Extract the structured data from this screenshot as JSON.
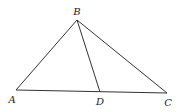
{
  "diagram": {
    "type": "geometry-triangle",
    "points": {
      "A": {
        "label": "A",
        "x": 16,
        "y": 90,
        "lx": 12,
        "ly": 103
      },
      "B": {
        "label": "B",
        "x": 77,
        "y": 20,
        "lx": 77,
        "ly": 15
      },
      "C": {
        "label": "C",
        "x": 167,
        "y": 93,
        "lx": 168,
        "ly": 106
      },
      "D": {
        "label": "D",
        "x": 100,
        "y": 92,
        "lx": 100,
        "ly": 105
      }
    },
    "segments": [
      {
        "from": "A",
        "to": "B"
      },
      {
        "from": "B",
        "to": "C"
      },
      {
        "from": "A",
        "to": "C"
      },
      {
        "from": "B",
        "to": "D"
      }
    ],
    "stroke_color": "#333333"
  }
}
